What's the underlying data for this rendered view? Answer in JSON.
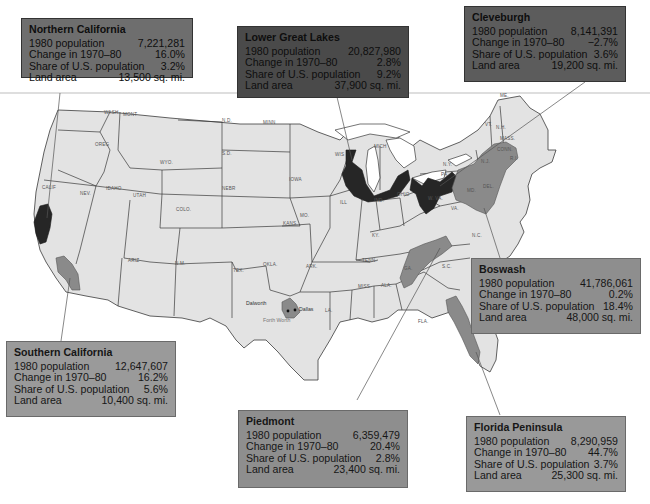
{
  "map": {
    "type": "choropleth-style regional map of contiguous United States",
    "state_labels": [
      "WASH",
      "MONT",
      "N.D.",
      "MINN",
      "OREG",
      "WYO.",
      "S.D.",
      "IDAHO",
      "WIS",
      "MICH",
      "N.Y.",
      "CALIF",
      "NEV.",
      "UTAH",
      "NEBR",
      "IOWA",
      "ILL",
      "IND.",
      "OHIO",
      "PA.",
      "COLO.",
      "KANS.",
      "MO.",
      "KY.",
      "W. VA.",
      "VA.",
      "ARIZ",
      "N.M.",
      "OKLA.",
      "ARK.",
      "TENN.",
      "N.C.",
      "S.C.",
      "TEX.",
      "MISS.",
      "ALA.",
      "GA.",
      "LA.",
      "FLA.",
      "ME.",
      "VT.",
      "N.H.",
      "MASS.",
      "CONN.",
      "R.I.",
      "N.J.",
      "DEL.",
      "MD."
    ],
    "city_labels": [
      "Dalworth",
      "Dallas",
      "Forth Worth"
    ]
  },
  "regions": [
    {
      "id": "northern-california",
      "name": "Northern California",
      "shade": "dark",
      "rows": [
        {
          "label": "1980 population",
          "value": "7,221,281"
        },
        {
          "label": "Change in 1970–80",
          "value": "16.0%"
        },
        {
          "label": "Share of U.S. population",
          "value": "3.2%"
        },
        {
          "label": "Land area",
          "value": "13,500 sq. mi."
        }
      ]
    },
    {
      "id": "lower-great-lakes",
      "name": "Lower Great Lakes",
      "shade": "dark",
      "rows": [
        {
          "label": "1980 population",
          "value": "20,827,980"
        },
        {
          "label": "Change in 1970–80",
          "value": "2.8%"
        },
        {
          "label": "Share of U.S. population",
          "value": "9.2%"
        },
        {
          "label": "Land area",
          "value": "37,900 sq. mi."
        }
      ]
    },
    {
      "id": "cleveburgh",
      "name": "Cleveburgh",
      "shade": "dark",
      "rows": [
        {
          "label": "1980 population",
          "value": "8,141,391"
        },
        {
          "label": "Change in 1970–80",
          "value": "−2.7%"
        },
        {
          "label": "Share of U.S. population",
          "value": "3.6%"
        },
        {
          "label": "Land area",
          "value": "19,200 sq. mi."
        }
      ]
    },
    {
      "id": "southern-california",
      "name": "Southern California",
      "shade": "mid",
      "rows": [
        {
          "label": "1980 population",
          "value": "12,647,607"
        },
        {
          "label": "Change in 1970–80",
          "value": "16.2%"
        },
        {
          "label": "Share of U.S. population",
          "value": "5.6%"
        },
        {
          "label": "Land area",
          "value": "10,400 sq. mi."
        }
      ]
    },
    {
      "id": "boswash",
      "name": "Boswash",
      "shade": "mid",
      "rows": [
        {
          "label": "1980 population",
          "value": "41,786,061"
        },
        {
          "label": "Change in 1970–80",
          "value": "0.2%"
        },
        {
          "label": "Share of U.S. population",
          "value": "18.4%"
        },
        {
          "label": "Land area",
          "value": "48,000 sq. mi."
        }
      ]
    },
    {
      "id": "piedmont",
      "name": "Piedmont",
      "shade": "mid",
      "rows": [
        {
          "label": "1980 population",
          "value": "6,359,479"
        },
        {
          "label": "Change in 1970–80",
          "value": "20.4%"
        },
        {
          "label": "Share of U.S. population",
          "value": "2.8%"
        },
        {
          "label": "Land area",
          "value": "23,400 sq. mi."
        }
      ]
    },
    {
      "id": "florida-peninsula",
      "name": "Florida Peninsula",
      "shade": "mid",
      "rows": [
        {
          "label": "1980 population",
          "value": "8,290,959"
        },
        {
          "label": "Change in 1970–80",
          "value": "44.7%"
        },
        {
          "label": "Share of U.S. population",
          "value": "3.7%"
        },
        {
          "label": "Land area",
          "value": "25,300 sq. mi."
        }
      ]
    }
  ],
  "colors": {
    "dark_region": "#262626",
    "mid_region": "#8a8a8a",
    "state_fill": "#e3e3e3",
    "box_mid": "#8e8e8e",
    "box_dark": "#4a4a4a"
  }
}
